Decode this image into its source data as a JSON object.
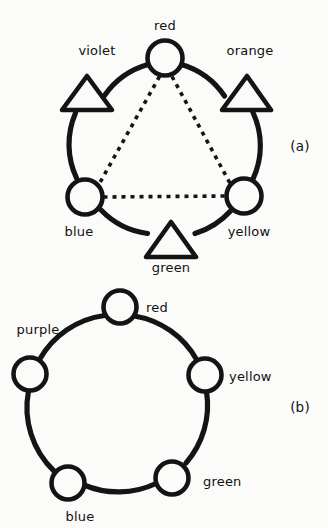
{
  "figure": {
    "background_color": "#fbfbfa",
    "ink_color": "#141414"
  },
  "panels": [
    {
      "id": "a",
      "caption": "(a)",
      "shape": "ring with six nodes",
      "nodes": [
        {
          "label": "red",
          "marker": "circle",
          "angle_deg": 90,
          "label_pos": "above"
        },
        {
          "label": "orange",
          "marker": "triangle",
          "angle_deg": 30,
          "label_pos": "above-right"
        },
        {
          "label": "yellow",
          "marker": "circle",
          "angle_deg": 330,
          "label_pos": "below-right"
        },
        {
          "label": "green",
          "marker": "triangle",
          "angle_deg": 270,
          "label_pos": "below"
        },
        {
          "label": "blue",
          "marker": "circle",
          "angle_deg": 210,
          "label_pos": "below-left"
        },
        {
          "label": "violet",
          "marker": "triangle",
          "angle_deg": 150,
          "label_pos": "above-left"
        }
      ],
      "chords": [
        {
          "from": "red",
          "to": "blue",
          "style": "dashed"
        },
        {
          "from": "red",
          "to": "yellow",
          "style": "dashed"
        },
        {
          "from": "blue",
          "to": "yellow",
          "style": "dashed"
        }
      ]
    },
    {
      "id": "b",
      "caption": "(b)",
      "shape": "ring with five nodes",
      "nodes": [
        {
          "label": "red",
          "marker": "circle",
          "angle_deg": 90,
          "label_pos": "right"
        },
        {
          "label": "yellow",
          "marker": "circle",
          "angle_deg": 18,
          "label_pos": "right"
        },
        {
          "label": "green",
          "marker": "circle",
          "angle_deg": 306,
          "label_pos": "right"
        },
        {
          "label": "blue",
          "marker": "circle",
          "angle_deg": 234,
          "label_pos": "below"
        },
        {
          "label": "purple",
          "marker": "circle",
          "angle_deg": 162,
          "label_pos": "above-left"
        }
      ],
      "chords": []
    }
  ],
  "labels": {
    "a_caption": "(a)",
    "b_caption": "(b)",
    "a_red": "red",
    "a_orange": "orange",
    "a_yellow": "yellow",
    "a_green": "green",
    "a_blue": "blue",
    "a_violet": "violet",
    "b_red": "red",
    "b_yellow": "yellow",
    "b_green": "green",
    "b_blue": "blue",
    "b_purple": "purple"
  }
}
